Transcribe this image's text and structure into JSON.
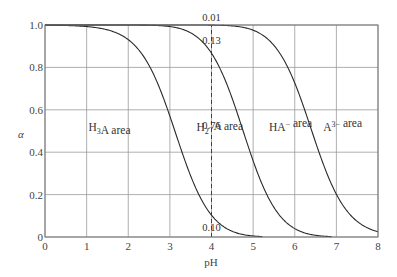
{
  "chart_data": {
    "type": "line",
    "title": "",
    "xlabel": "pH",
    "ylabel": "α",
    "xlim": [
      0,
      8
    ],
    "ylim": [
      0,
      1.0
    ],
    "x_ticks": [
      "0",
      "1",
      "2",
      "3",
      "4",
      "5",
      "6",
      "7",
      "8"
    ],
    "y_ticks": [
      "0",
      "0.2",
      "0.4",
      "0.6",
      "0.8",
      "1.0"
    ],
    "grid": true,
    "legend": null,
    "pKa": [
      3.13,
      4.76,
      6.4
    ],
    "x": [
      0,
      0.5,
      1,
      1.5,
      2,
      2.5,
      3,
      3.5,
      4,
      4.5,
      5,
      5.5,
      6,
      6.5,
      7,
      7.5,
      8
    ],
    "series": [
      {
        "name": "H3A boundary (δ0)",
        "values": [
          1.0,
          1.0,
          0.99,
          0.98,
          0.93,
          0.81,
          0.57,
          0.29,
          0.1,
          0.03,
          0.01,
          0.0,
          0.0,
          0.0,
          0.0,
          0.0,
          0.0
        ]
      },
      {
        "name": "H3A + H2A- boundary (δ0+δ1)",
        "values": [
          1.0,
          1.0,
          1.0,
          1.0,
          1.0,
          0.99,
          0.98,
          0.95,
          0.86,
          0.65,
          0.36,
          0.15,
          0.05,
          0.02,
          0.0,
          0.0,
          0.0
        ]
      },
      {
        "name": "H3A + H2A- + HA2- boundary (δ0+δ1+δ2)",
        "values": [
          1.0,
          1.0,
          1.0,
          1.0,
          1.0,
          1.0,
          1.0,
          1.0,
          0.99,
          0.99,
          0.96,
          0.89,
          0.72,
          0.44,
          0.2,
          0.07,
          0.02
        ]
      }
    ],
    "annotations": [
      {
        "text": "0.01",
        "x": 4,
        "y": 1.0,
        "position": "above"
      },
      {
        "text": "0.13",
        "x": 4,
        "y": 0.93
      },
      {
        "text": "0.76",
        "x": 4,
        "y": 0.54
      },
      {
        "text": "0.10",
        "x": 4,
        "y": 0.05
      }
    ],
    "dashed_line": {
      "x": 4,
      "y_from": 0,
      "y_to": 1.0
    },
    "regions": [
      {
        "label_main": "H",
        "label_sub": "3",
        "label_sup": "",
        "label_rest": "A  area",
        "x": 1.55,
        "y": 0.52
      },
      {
        "label_main": "H",
        "label_sub": "2",
        "label_sup": "−",
        "label_rest": "A  area",
        "x": 4.2,
        "y": 0.52
      },
      {
        "label_main": "HA",
        "label_sub": "",
        "label_sup": "−",
        "label_rest": " area",
        "x": 5.9,
        "y": 0.52
      },
      {
        "label_main": "A",
        "label_sub": "",
        "label_sup": "3−",
        "label_rest": " area",
        "x": 7.15,
        "y": 0.52
      }
    ]
  }
}
